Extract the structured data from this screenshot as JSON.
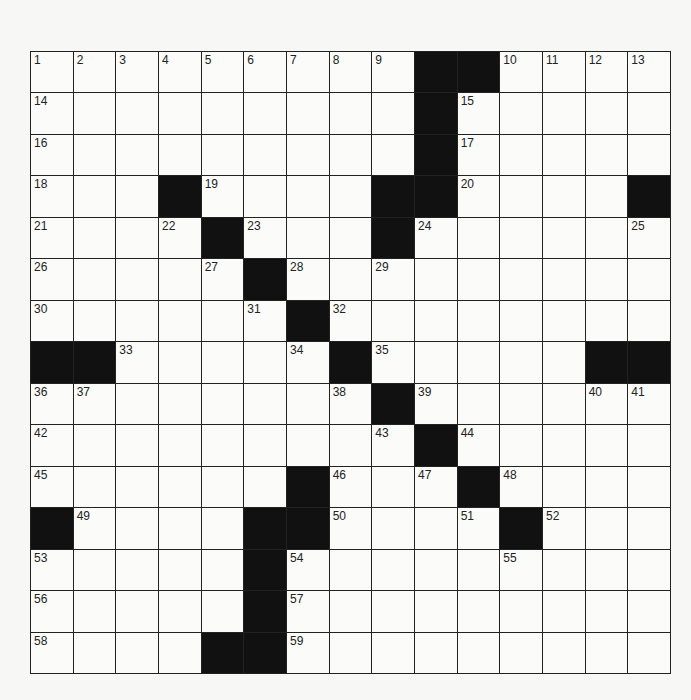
{
  "puzzle": {
    "rows": 15,
    "cols": 15,
    "grid": [
      ".........##....",
      ".........#.....",
      ".........#.....",
      "...#....##....#",
      "....#...#......",
      ".....#.........",
      "......#........",
      "##.....#.....##",
      "........#......",
      ".........#.....",
      "......#...#....",
      "#....##....#...",
      ".....#.........",
      ".....#.........",
      "....##........."
    ],
    "numbers": [
      {
        "r": 0,
        "c": 0,
        "n": "1"
      },
      {
        "r": 0,
        "c": 1,
        "n": "2"
      },
      {
        "r": 0,
        "c": 2,
        "n": "3"
      },
      {
        "r": 0,
        "c": 3,
        "n": "4"
      },
      {
        "r": 0,
        "c": 4,
        "n": "5"
      },
      {
        "r": 0,
        "c": 5,
        "n": "6"
      },
      {
        "r": 0,
        "c": 6,
        "n": "7"
      },
      {
        "r": 0,
        "c": 7,
        "n": "8"
      },
      {
        "r": 0,
        "c": 8,
        "n": "9"
      },
      {
        "r": 0,
        "c": 11,
        "n": "10"
      },
      {
        "r": 0,
        "c": 12,
        "n": "11"
      },
      {
        "r": 0,
        "c": 13,
        "n": "12"
      },
      {
        "r": 0,
        "c": 14,
        "n": "13"
      },
      {
        "r": 1,
        "c": 0,
        "n": "14"
      },
      {
        "r": 1,
        "c": 10,
        "n": "15"
      },
      {
        "r": 2,
        "c": 0,
        "n": "16"
      },
      {
        "r": 2,
        "c": 10,
        "n": "17"
      },
      {
        "r": 3,
        "c": 0,
        "n": "18"
      },
      {
        "r": 3,
        "c": 4,
        "n": "19"
      },
      {
        "r": 3,
        "c": 10,
        "n": "20"
      },
      {
        "r": 4,
        "c": 0,
        "n": "21"
      },
      {
        "r": 4,
        "c": 3,
        "n": "22"
      },
      {
        "r": 4,
        "c": 5,
        "n": "23"
      },
      {
        "r": 4,
        "c": 9,
        "n": "24"
      },
      {
        "r": 4,
        "c": 14,
        "n": "25"
      },
      {
        "r": 5,
        "c": 0,
        "n": "26"
      },
      {
        "r": 5,
        "c": 4,
        "n": "27"
      },
      {
        "r": 5,
        "c": 6,
        "n": "28"
      },
      {
        "r": 5,
        "c": 8,
        "n": "29"
      },
      {
        "r": 6,
        "c": 0,
        "n": "30"
      },
      {
        "r": 6,
        "c": 5,
        "n": "31"
      },
      {
        "r": 6,
        "c": 7,
        "n": "32"
      },
      {
        "r": 7,
        "c": 2,
        "n": "33"
      },
      {
        "r": 7,
        "c": 6,
        "n": "34"
      },
      {
        "r": 7,
        "c": 8,
        "n": "35"
      },
      {
        "r": 8,
        "c": 0,
        "n": "36"
      },
      {
        "r": 8,
        "c": 1,
        "n": "37"
      },
      {
        "r": 8,
        "c": 7,
        "n": "38"
      },
      {
        "r": 8,
        "c": 9,
        "n": "39"
      },
      {
        "r": 8,
        "c": 13,
        "n": "40"
      },
      {
        "r": 8,
        "c": 14,
        "n": "41"
      },
      {
        "r": 9,
        "c": 0,
        "n": "42"
      },
      {
        "r": 9,
        "c": 8,
        "n": "43"
      },
      {
        "r": 9,
        "c": 10,
        "n": "44"
      },
      {
        "r": 10,
        "c": 0,
        "n": "45"
      },
      {
        "r": 10,
        "c": 7,
        "n": "46"
      },
      {
        "r": 10,
        "c": 9,
        "n": "47"
      },
      {
        "r": 10,
        "c": 11,
        "n": "48"
      },
      {
        "r": 11,
        "c": 1,
        "n": "49"
      },
      {
        "r": 11,
        "c": 7,
        "n": "50"
      },
      {
        "r": 11,
        "c": 10,
        "n": "51"
      },
      {
        "r": 11,
        "c": 12,
        "n": "52"
      },
      {
        "r": 12,
        "c": 0,
        "n": "53"
      },
      {
        "r": 12,
        "c": 6,
        "n": "54"
      },
      {
        "r": 12,
        "c": 11,
        "n": "55"
      },
      {
        "r": 13,
        "c": 0,
        "n": "56"
      },
      {
        "r": 13,
        "c": 6,
        "n": "57"
      },
      {
        "r": 14,
        "c": 0,
        "n": "58"
      },
      {
        "r": 14,
        "c": 6,
        "n": "59"
      }
    ]
  },
  "colors": {
    "black_square": "#111111",
    "white_square": "#fbfbf9",
    "grid_line": "#222222"
  }
}
